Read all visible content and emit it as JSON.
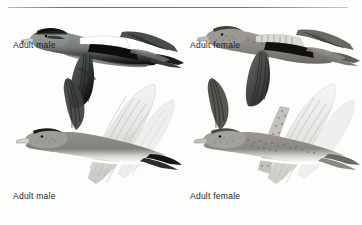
{
  "plate": {
    "width": 362,
    "height": 225,
    "background_color": "#fdfdfc",
    "divider_color": "#7a7a7a",
    "caption_color": "#1d1d1d",
    "subject": "American Wigeon in flight",
    "figure_count": 4
  },
  "captions": {
    "top_left": "Adult male",
    "top_right": "Adult female",
    "bottom_left": "Adult male",
    "bottom_right": "Adult female"
  },
  "figures": [
    {
      "id": "top-left",
      "label": "Adult male",
      "view": "upperside",
      "sex": "male",
      "plumage_colors": {
        "crown": "#141414",
        "head": "#8d8f8c",
        "bill": "#cfd0cc",
        "body": "#6e7270",
        "wing_patch": "#ffffff",
        "speculum": "#0e0e0e",
        "flight_feathers": "#3a3c3b",
        "tail": "#1a1a1a"
      }
    },
    {
      "id": "top-right",
      "label": "Adult female",
      "view": "upperside",
      "sex": "female",
      "plumage_colors": {
        "crown": "#3d3b38",
        "head": "#9a9893",
        "bill": "#b9bab6",
        "body": "#8a8782",
        "wing_patch": "#d9d7d2",
        "speculum": "#121212",
        "flight_feathers": "#4a4947",
        "tail": "#5b5a57"
      }
    },
    {
      "id": "bottom-left",
      "label": "Adult male",
      "view": "underside",
      "sex": "male",
      "plumage_colors": {
        "crown": "#1c1c1c",
        "head": "#9c9e9a",
        "bill": "#d2d3cf",
        "breast": "#8e8d88",
        "belly": "#fbfbfa",
        "underwing": "#e3e3e1",
        "wing_lining": "#cfcfcd",
        "tail": "#151515"
      }
    },
    {
      "id": "bottom-right",
      "label": "Adult female",
      "view": "underside",
      "sex": "female",
      "plumage_colors": {
        "crown": "#4b4945",
        "head": "#a3a19c",
        "bill": "#bfc0bc",
        "breast": "#9b9892",
        "belly": "#fafaf9",
        "underwing": "#e6e6e4",
        "wing_lining": "#d2d2cf",
        "tail": "#6a6865"
      }
    }
  ]
}
